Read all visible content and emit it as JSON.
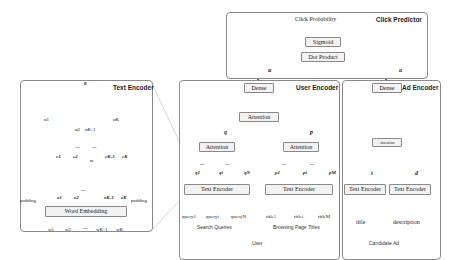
{
  "click_predictor": {
    "title": "Click Predictor",
    "output": "Click Probability",
    "sigmoid": "Sigmoid",
    "dot_product": "Dot Product",
    "u_label": "u",
    "a_label": "a"
  },
  "user_encoder": {
    "title": "User Encoder",
    "dense": "Dense",
    "attention_top": "Attention",
    "q_label": "q",
    "p_label": "p",
    "attention_q": "Attention",
    "attention_p": "Attention",
    "q_vectors": [
      "q1",
      "qi",
      "qN"
    ],
    "p_vectors": [
      "p1",
      "pi",
      "pM"
    ],
    "text_encoder_q": "Text Encoder",
    "text_encoder_p": "Text Encoder",
    "queries": [
      "query1",
      "queryi",
      "queryN"
    ],
    "titles": [
      "title1",
      "titlei",
      "titleM"
    ],
    "ellipsis": "...",
    "search_queries": "Search Queries",
    "browsing_page_titles": "Browsing Page Titles",
    "user": "User"
  },
  "ad_encoder": {
    "title": "Ad Encoder",
    "dense": "Dense",
    "attention": "Attention",
    "t_label": "t",
    "d_label": "d",
    "text_encoder_title": "Text Encoder",
    "text_encoder_desc": "Text Encoder",
    "title_label": "title",
    "description_label": "description",
    "candidate_ad": "Candidate Ad"
  },
  "text_encoder": {
    "title": "Text Encoder",
    "e_label": "e",
    "alpha_1": "α1",
    "alpha_2": "α2",
    "alpha_k1": "αK-1",
    "alpha_k": "αK",
    "c_labels": [
      "c1",
      "c2",
      "cK-1",
      "cK"
    ],
    "w_label": "w",
    "e_labels": [
      "e1",
      "e2",
      "eK-1",
      "eK"
    ],
    "padding_left": "padding",
    "padding_right": "padding",
    "word_embedding": "Word Embedding",
    "words": [
      "w1",
      "w2",
      "wK-1",
      "wK"
    ],
    "ellipsis": "..."
  },
  "colors": {
    "border": "#8a8a8a",
    "box_fill": "#f2f2f2",
    "vector_fill": "#f5f5f5",
    "text": "#222222"
  }
}
